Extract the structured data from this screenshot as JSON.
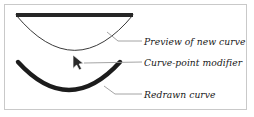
{
  "figure": {
    "background_color": "#ffffff",
    "frame_color": "#c9c9c9",
    "ink_color": "#171717",
    "leader_color": "#9a9a9a",
    "thin_curve_color": "#3a3a3a"
  },
  "annotations": [
    {
      "id": "preview",
      "label": "Preview of new curve",
      "icon": "leader-line-icon",
      "target": "thin preview curve"
    },
    {
      "id": "modifier",
      "label": "Curve-point modifier",
      "icon": "cursor-arrow-icon",
      "target": "mouse pointer handle"
    },
    {
      "id": "redrawn",
      "label": "Redrawn curve",
      "icon": "leader-line-icon",
      "target": "thick bottom curve"
    }
  ],
  "shapes": {
    "straight_bar": {
      "name": "original-straight-curve",
      "from_x": 16,
      "from_y": 15,
      "to_x": 133,
      "to_y": 15,
      "stroke": 4.2,
      "color": "#262626"
    },
    "preview_curve": {
      "name": "preview-new-curve",
      "start_x": 16,
      "start_y": 15,
      "control_x": 75,
      "control_y": 86,
      "end_x": 133,
      "end_y": 15,
      "stroke": 1.0,
      "color": "#3a3a3a"
    },
    "redrawn_curve": {
      "name": "redrawn-curve",
      "start_x": 18,
      "start_y": 62,
      "control_x": 69,
      "control_y": 118,
      "end_x": 120,
      "end_y": 62,
      "stroke": 4.2,
      "color": "#1c1c1c"
    },
    "cursor": {
      "name": "cursor-arrow-icon",
      "tip_x": 73,
      "tip_y": 55,
      "color": "#2a2a2a"
    }
  },
  "leaders": {
    "preview": {
      "x1": 107,
      "y1": 32,
      "x2": 118,
      "y2": 41,
      "x3": 142,
      "y3": 41
    },
    "modifier": {
      "x1": 83,
      "y1": 63,
      "x2": 142,
      "y2": 62
    },
    "redrawn": {
      "x1": 104,
      "y1": 86,
      "x2": 115,
      "y2": 94,
      "x3": 142,
      "y3": 94
    }
  }
}
